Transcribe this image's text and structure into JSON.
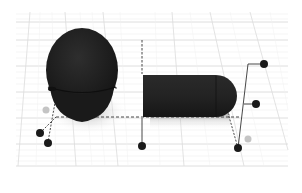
{
  "viewport": {
    "type": "3d-workplane",
    "background": "#ffffff",
    "grid_color": "#d9d9d9",
    "grid_minor_color": "#eeeeee",
    "object_color": "#222222",
    "handle_color": "#1a1a1a",
    "handle_inactive_color": "#c4c4c4",
    "dashed_line_color": "#333333"
  },
  "objects": [
    {
      "name": "sphere",
      "shape": "ellipsoid"
    },
    {
      "name": "capsule",
      "shape": "half-rounded cylinder"
    }
  ],
  "handles": [
    {
      "name": "corner-handle-left-back",
      "state": "active"
    },
    {
      "name": "corner-handle-left-front",
      "state": "active"
    },
    {
      "name": "corner-handle-left-top",
      "state": "inactive"
    },
    {
      "name": "corner-handle-center-front",
      "state": "active"
    },
    {
      "name": "corner-handle-right-front",
      "state": "active"
    },
    {
      "name": "corner-handle-right-back",
      "state": "inactive"
    },
    {
      "name": "height-handle-top",
      "state": "active"
    },
    {
      "name": "height-handle-mid",
      "state": "active"
    }
  ]
}
